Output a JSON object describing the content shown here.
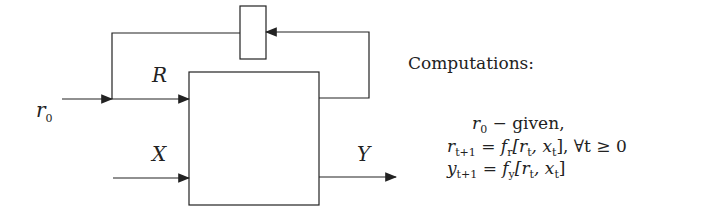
{
  "diagram": {
    "labels": {
      "r0": "r",
      "r0_sub": "0",
      "R": "R",
      "X": "X",
      "Y": "Y"
    },
    "computations_title": "Computations:",
    "equations": [
      {
        "lhs": "r",
        "lhs_sub": "0",
        "rhs": " − given,"
      },
      {
        "lhs": "r",
        "lhs_sub": "t+1",
        "rhs": " = f",
        "rhs_sub": "r",
        "rest": "[r",
        "rest_sub1": "t",
        "mid": ", x",
        "rest_sub2": "t",
        "tail": "], ∀t ≥ 0"
      },
      {
        "lhs": "y",
        "lhs_sub": "t+1",
        "rhs": " = f",
        "rhs_sub": "y",
        "rest": "[r",
        "rest_sub1": "t",
        "mid": ", x",
        "rest_sub2": "t",
        "tail": "]"
      }
    ]
  }
}
